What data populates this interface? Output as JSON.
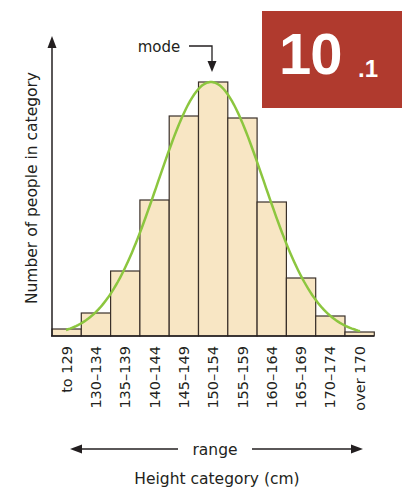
{
  "badge": {
    "main": "10",
    "sub": ".1",
    "color": "#b03a2e"
  },
  "annotations": {
    "mode": "mode",
    "range": "range"
  },
  "colors": {
    "bar_fill": "#f8e6c4",
    "bar_stroke": "#3a302a",
    "curve": "#8cc63f",
    "axis": "#231f20"
  },
  "chart_data": {
    "type": "bar",
    "title": "",
    "xlabel": "Height category (cm)",
    "ylabel": "Number of people in category",
    "categories": [
      "to 129",
      "130–134",
      "135–139",
      "140–144",
      "145–149",
      "150–154",
      "155–159",
      "160–164",
      "165–169",
      "170–174",
      "over 170"
    ],
    "values": [
      7,
      23,
      65,
      136,
      220,
      254,
      218,
      134,
      58,
      20,
      4
    ],
    "value_units": "relative bar height (no numeric y-axis shown)",
    "overlay": {
      "type": "line",
      "name": "normal distribution curve",
      "shape": "bell curve peaking at 150–154"
    },
    "annotations": [
      {
        "text": "mode",
        "points_to": "150–154"
      },
      {
        "text": "range",
        "spans": "to 129 → over 170"
      }
    ],
    "ylim": [
      0,
      290
    ],
    "grid": false,
    "legend": null
  }
}
